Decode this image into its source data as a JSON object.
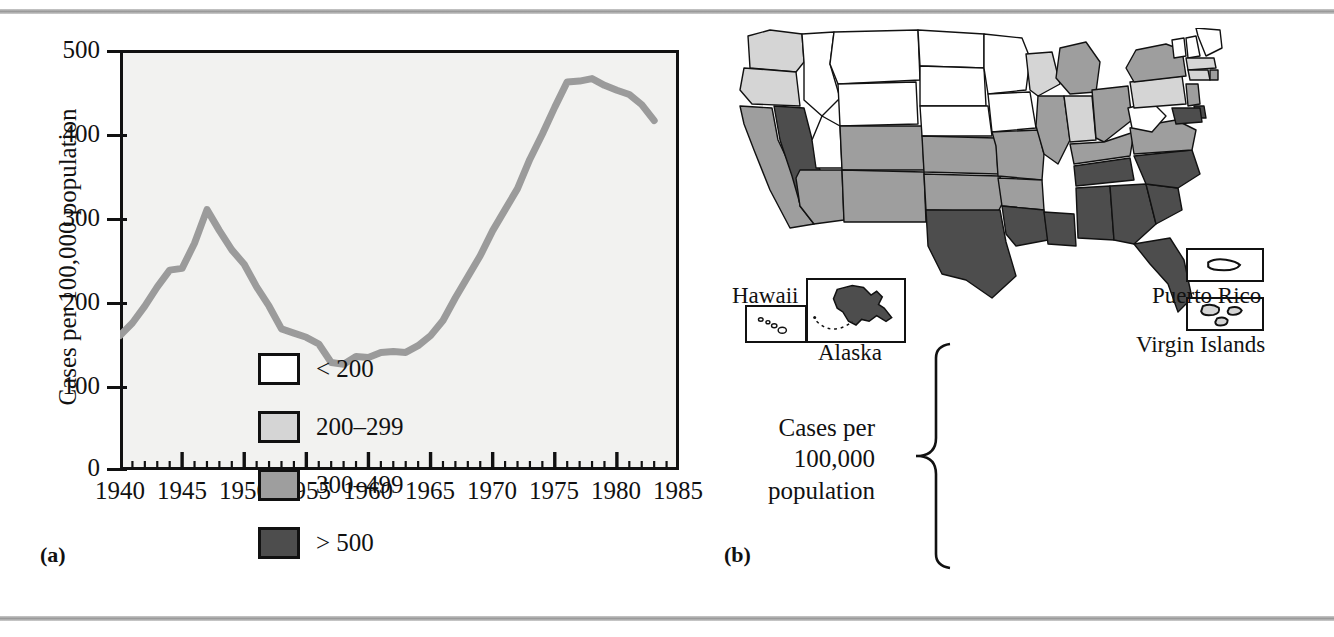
{
  "figure": {
    "panel_a_label": "(a)",
    "panel_b_label": "(b)"
  },
  "chart_data": {
    "type": "line",
    "title": "",
    "xlabel": "",
    "ylabel": "Cases per 100,000 population",
    "xlim": [
      1940,
      1985
    ],
    "ylim": [
      0,
      500
    ],
    "xticks": [
      1940,
      1945,
      1950,
      1955,
      1960,
      1965,
      1970,
      1975,
      1980,
      1985
    ],
    "yticks": [
      0,
      100,
      200,
      300,
      400,
      500
    ],
    "minor_x_tick_interval": 1,
    "grid": false,
    "legend": "none",
    "line_color": "#9b9b9b",
    "x": [
      1940,
      1941,
      1942,
      1943,
      1944,
      1945,
      1946,
      1947,
      1948,
      1949,
      1950,
      1951,
      1952,
      1953,
      1954,
      1955,
      1956,
      1957,
      1958,
      1959,
      1960,
      1961,
      1962,
      1963,
      1964,
      1965,
      1966,
      1967,
      1968,
      1969,
      1970,
      1971,
      1972,
      1973,
      1974,
      1975,
      1976,
      1977,
      1978,
      1979,
      1980,
      1981,
      1982,
      1983
    ],
    "values": [
      160,
      175,
      195,
      218,
      238,
      240,
      270,
      310,
      285,
      262,
      245,
      218,
      195,
      168,
      163,
      158,
      150,
      128,
      126,
      135,
      134,
      140,
      141,
      140,
      148,
      160,
      178,
      205,
      230,
      255,
      285,
      310,
      335,
      370,
      400,
      432,
      462,
      463,
      466,
      458,
      452,
      447,
      435,
      416
    ]
  },
  "yaxis": {
    "title": "Cases per 100,000 population",
    "labels": [
      "500",
      "400",
      "300",
      "200",
      "100",
      "0"
    ]
  },
  "xaxis": {
    "labels": [
      "1940",
      "1945",
      "1950",
      "1955",
      "1960",
      "1965",
      "1970",
      "1975",
      "1980",
      "1985"
    ]
  },
  "map": {
    "title": "",
    "legend": {
      "title_line1": "Cases per",
      "title_line2": "100,000 population",
      "items": [
        {
          "label": "< 200",
          "color": "#ffffff"
        },
        {
          "label": "200–299",
          "color": "#d5d5d5"
        },
        {
          "label": "300–499",
          "color": "#9e9e9e"
        },
        {
          "label": "> 500",
          "color": "#4d4d4d"
        }
      ]
    },
    "insets": [
      {
        "name": "Hawaii",
        "caption": "Hawaii",
        "color": "#ffffff"
      },
      {
        "name": "Alaska",
        "caption": "Alaska",
        "color": "#4d4d4d"
      },
      {
        "name": "Puerto Rico",
        "caption": "Puerto Rico",
        "color": "#ffffff"
      },
      {
        "name": "Virgin Islands",
        "caption": "Virgin Islands",
        "color": "#d5d5d5"
      }
    ],
    "states": [
      {
        "code": "WA",
        "color": "#d5d5d5"
      },
      {
        "code": "OR",
        "color": "#d5d5d5"
      },
      {
        "code": "CA",
        "color": "#9e9e9e"
      },
      {
        "code": "NV",
        "color": "#4d4d4d"
      },
      {
        "code": "ID",
        "color": "#ffffff"
      },
      {
        "code": "MT",
        "color": "#ffffff"
      },
      {
        "code": "WY",
        "color": "#ffffff"
      },
      {
        "code": "UT",
        "color": "#ffffff"
      },
      {
        "code": "AZ",
        "color": "#9e9e9e"
      },
      {
        "code": "CO",
        "color": "#9e9e9e"
      },
      {
        "code": "NM",
        "color": "#9e9e9e"
      },
      {
        "code": "ND",
        "color": "#ffffff"
      },
      {
        "code": "SD",
        "color": "#ffffff"
      },
      {
        "code": "NE",
        "color": "#ffffff"
      },
      {
        "code": "KS",
        "color": "#9e9e9e"
      },
      {
        "code": "OK",
        "color": "#9e9e9e"
      },
      {
        "code": "TX",
        "color": "#4d4d4d"
      },
      {
        "code": "MN",
        "color": "#ffffff"
      },
      {
        "code": "IA",
        "color": "#ffffff"
      },
      {
        "code": "MO",
        "color": "#9e9e9e"
      },
      {
        "code": "AR",
        "color": "#9e9e9e"
      },
      {
        "code": "LA",
        "color": "#4d4d4d"
      },
      {
        "code": "WI",
        "color": "#d5d5d5"
      },
      {
        "code": "IL",
        "color": "#9e9e9e"
      },
      {
        "code": "MS",
        "color": "#4d4d4d"
      },
      {
        "code": "MI",
        "color": "#9e9e9e"
      },
      {
        "code": "IN",
        "color": "#d5d5d5"
      },
      {
        "code": "OH",
        "color": "#9e9e9e"
      },
      {
        "code": "KY",
        "color": "#9e9e9e"
      },
      {
        "code": "TN",
        "color": "#4d4d4d"
      },
      {
        "code": "AL",
        "color": "#4d4d4d"
      },
      {
        "code": "GA",
        "color": "#4d4d4d"
      },
      {
        "code": "FL",
        "color": "#4d4d4d"
      },
      {
        "code": "SC",
        "color": "#4d4d4d"
      },
      {
        "code": "NC",
        "color": "#4d4d4d"
      },
      {
        "code": "VA",
        "color": "#9e9e9e"
      },
      {
        "code": "WV",
        "color": "#ffffff"
      },
      {
        "code": "PA",
        "color": "#d5d5d5"
      },
      {
        "code": "NY",
        "color": "#9e9e9e"
      },
      {
        "code": "VT",
        "color": "#ffffff"
      },
      {
        "code": "NH",
        "color": "#ffffff"
      },
      {
        "code": "ME",
        "color": "#ffffff"
      },
      {
        "code": "MA",
        "color": "#d5d5d5"
      },
      {
        "code": "CT",
        "color": "#d5d5d5"
      },
      {
        "code": "RI",
        "color": "#9e9e9e"
      },
      {
        "code": "NJ",
        "color": "#9e9e9e"
      },
      {
        "code": "DE",
        "color": "#4d4d4d"
      },
      {
        "code": "MD",
        "color": "#4d4d4d"
      }
    ]
  }
}
